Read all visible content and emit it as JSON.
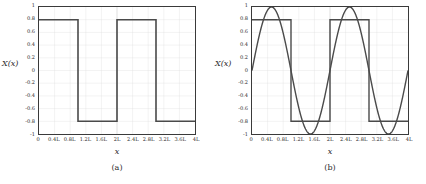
{
  "figure": {
    "background": "#ffffff",
    "axis_color": "#3a3a3a",
    "grid_color": "#c9c9c9",
    "grid_minor_color": "#e2e2e2",
    "series_color": "#4a4a4a"
  },
  "panels": [
    {
      "id": "panel-a",
      "subcaption": "(a)",
      "xlabel": "x",
      "ylabel": "X(x)"
    },
    {
      "id": "panel-b",
      "subcaption": "(b)",
      "xlabel": "x",
      "ylabel": "X(x)"
    }
  ],
  "ticks": {
    "x": [
      "0",
      "0.4L",
      "0.8L",
      "1.2L",
      "1.6L",
      "2L",
      "2.4L",
      "2.8L",
      "3.2L",
      "3.6L",
      "4L"
    ],
    "y": [
      "1",
      "0.8",
      "0.6",
      "0.4",
      "0.2",
      "0",
      "-0.2",
      "-0.4",
      "-0.6",
      "-0.8",
      "-1"
    ]
  },
  "chart_data": [
    {
      "type": "line",
      "title": "(a)",
      "xlabel": "x",
      "ylabel": "X(x)",
      "xlim": [
        0,
        4
      ],
      "ylim": [
        -1,
        1
      ],
      "xtick_values": [
        0,
        0.4,
        0.8,
        1.2,
        1.6,
        2.0,
        2.4,
        2.8,
        3.2,
        3.6,
        4.0
      ],
      "xtick_labels": [
        "0",
        "0.4L",
        "0.8L",
        "1.2L",
        "1.6L",
        "2L",
        "2.4L",
        "2.8L",
        "3.2L",
        "3.6L",
        "4L"
      ],
      "ytick_values": [
        1,
        0.8,
        0.6,
        0.4,
        0.2,
        0,
        -0.2,
        -0.4,
        -0.6,
        -0.8,
        -1
      ],
      "ytick_labels": [
        "1",
        "0.8",
        "0.6",
        "0.4",
        "0.2",
        "0",
        "-0.2",
        "-0.4",
        "-0.6",
        "-0.8",
        "-1"
      ],
      "grid": true,
      "legend": null,
      "series": [
        {
          "name": "square-wave",
          "description": "Square wave of amplitude 0.8, period 2L, starting at +0.8 on [0,L), dropping to -0.8 on [L,2L), repeating.",
          "amplitude": 0.8,
          "period": 2.0,
          "points": [
            [
              0.0,
              0.8
            ],
            [
              1.0,
              0.8
            ],
            [
              1.0,
              -0.8
            ],
            [
              2.0,
              -0.8
            ],
            [
              2.0,
              0.8
            ],
            [
              3.0,
              0.8
            ],
            [
              3.0,
              -0.8
            ],
            [
              4.0,
              -0.8
            ]
          ]
        }
      ]
    },
    {
      "type": "line",
      "title": "(b)",
      "xlabel": "x",
      "ylabel": "X(x)",
      "xlim": [
        0,
        4
      ],
      "ylim": [
        -1,
        1
      ],
      "xtick_values": [
        0,
        0.4,
        0.8,
        1.2,
        1.6,
        2.0,
        2.4,
        2.8,
        3.2,
        3.6,
        4.0
      ],
      "xtick_labels": [
        "0",
        "0.4L",
        "0.8L",
        "1.2L",
        "1.6L",
        "2L",
        "2.4L",
        "2.8L",
        "3.2L",
        "3.6L",
        "4L"
      ],
      "ytick_values": [
        1,
        0.8,
        0.6,
        0.4,
        0.2,
        0,
        -0.2,
        -0.4,
        -0.6,
        -0.8,
        -1
      ],
      "ytick_labels": [
        "1",
        "0.8",
        "0.6",
        "0.4",
        "0.2",
        "0",
        "-0.2",
        "-0.4",
        "-0.6",
        "-0.8",
        "-1"
      ],
      "grid": true,
      "legend": null,
      "series": [
        {
          "name": "square-wave",
          "description": "Square wave of amplitude 0.8, period 2L, starting at +0.8 on [0,L), dropping to -0.8 on [L,2L), repeating.",
          "amplitude": 0.8,
          "period": 2.0,
          "points": [
            [
              0.0,
              0.8
            ],
            [
              1.0,
              0.8
            ],
            [
              1.0,
              -0.8
            ],
            [
              2.0,
              -0.8
            ],
            [
              2.0,
              0.8
            ],
            [
              3.0,
              0.8
            ],
            [
              3.0,
              -0.8
            ],
            [
              4.0,
              -0.8
            ]
          ]
        },
        {
          "name": "sine-fundamental",
          "description": "First Fourier harmonic: amplitude 1, period 2L, sin(pi*x/L), zero at x=0, peak +1 at 0.5L, zero at L, trough -1 at 1.5L.",
          "amplitude": 1.0,
          "period": 2.0,
          "formula": "sin(pi*x/L)"
        }
      ]
    }
  ]
}
